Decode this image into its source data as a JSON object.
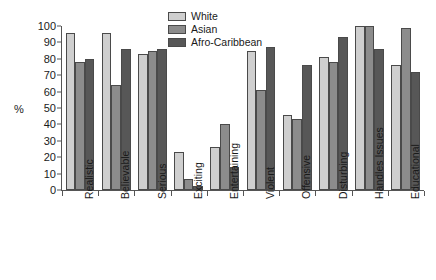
{
  "chart_data": {
    "type": "bar",
    "title": "",
    "xlabel": "",
    "ylabel": "%",
    "ylim": [
      0,
      100
    ],
    "yticks": [
      0,
      10,
      20,
      30,
      40,
      50,
      60,
      70,
      80,
      90,
      100
    ],
    "grid": false,
    "legend_position": "top-center",
    "categories": [
      "Realistic",
      "Believable",
      "Serious",
      "Exciting",
      "Entertaining",
      "Violent",
      "Offensive",
      "Disturbing",
      "Handles Issues",
      "Educational"
    ],
    "series": [
      {
        "name": "White",
        "color": "#cfcfcf",
        "values": [
          96,
          96,
          83,
          23,
          26,
          85,
          46,
          81,
          100,
          76
        ]
      },
      {
        "name": "Asian",
        "color": "#8c8c8c",
        "values": [
          78,
          64,
          85,
          7,
          40,
          61,
          43,
          78,
          100,
          99
        ]
      },
      {
        "name": "Afro-Caribbean",
        "color": "#575757",
        "values": [
          80,
          86,
          86,
          2.5,
          14,
          87,
          76,
          93,
          86,
          72
        ]
      }
    ]
  }
}
